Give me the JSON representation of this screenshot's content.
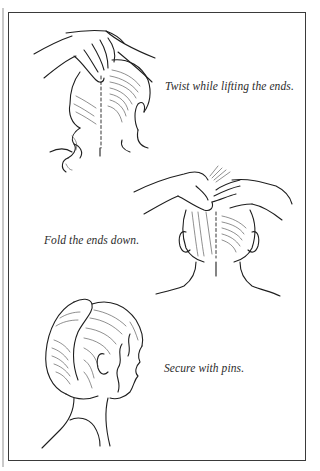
{
  "page": {
    "type": "instruction-illustration",
    "steps": [
      {
        "index": 1,
        "caption": "Twist while lifting the ends.",
        "illustration": "back-of-head-hands-twisting-hair"
      },
      {
        "index": 2,
        "caption": "Fold the ends down.",
        "illustration": "back-of-head-hands-folding-ends"
      },
      {
        "index": 3,
        "caption": "Secure with pins.",
        "illustration": "profile-head-finished-french-twist"
      }
    ]
  },
  "colors": {
    "line_art": "#1e1e1e",
    "frame_border": "#3a3a3a",
    "caption_text": "#2b2b2b",
    "background": "#ffffff",
    "gutter": "#c9c9c9"
  }
}
